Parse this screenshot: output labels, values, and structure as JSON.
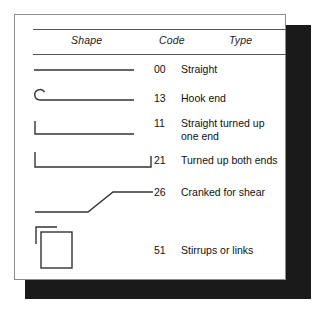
{
  "figure": {
    "name": "bar-shape-code-table",
    "background_color": "#ffffff",
    "card_color": "#ffffff",
    "border_color": "#8d8d8d",
    "shadow_color": "#1a1a1a",
    "line_color": "#333333",
    "text_color": "#111111"
  },
  "table": {
    "columns": {
      "shape": "Shape",
      "code": "Code",
      "type": "Type"
    },
    "rows": [
      {
        "shape_icon": "straight-bar-icon",
        "code": "00",
        "type": "Straight"
      },
      {
        "shape_icon": "hook-end-bar-icon",
        "code": "13",
        "type": "Hook end"
      },
      {
        "shape_icon": "turned-up-one-end-bar-icon",
        "code": "11",
        "type": "Straight turned up\none end"
      },
      {
        "shape_icon": "turned-up-both-ends-bar-icon",
        "code": "21",
        "type": "Turned up both ends"
      },
      {
        "shape_icon": "cranked-bar-icon",
        "code": "26",
        "type": "Cranked for shear"
      },
      {
        "shape_icon": "stirrup-link-icon",
        "code": "51",
        "type": "Stirrups or links"
      }
    ]
  }
}
